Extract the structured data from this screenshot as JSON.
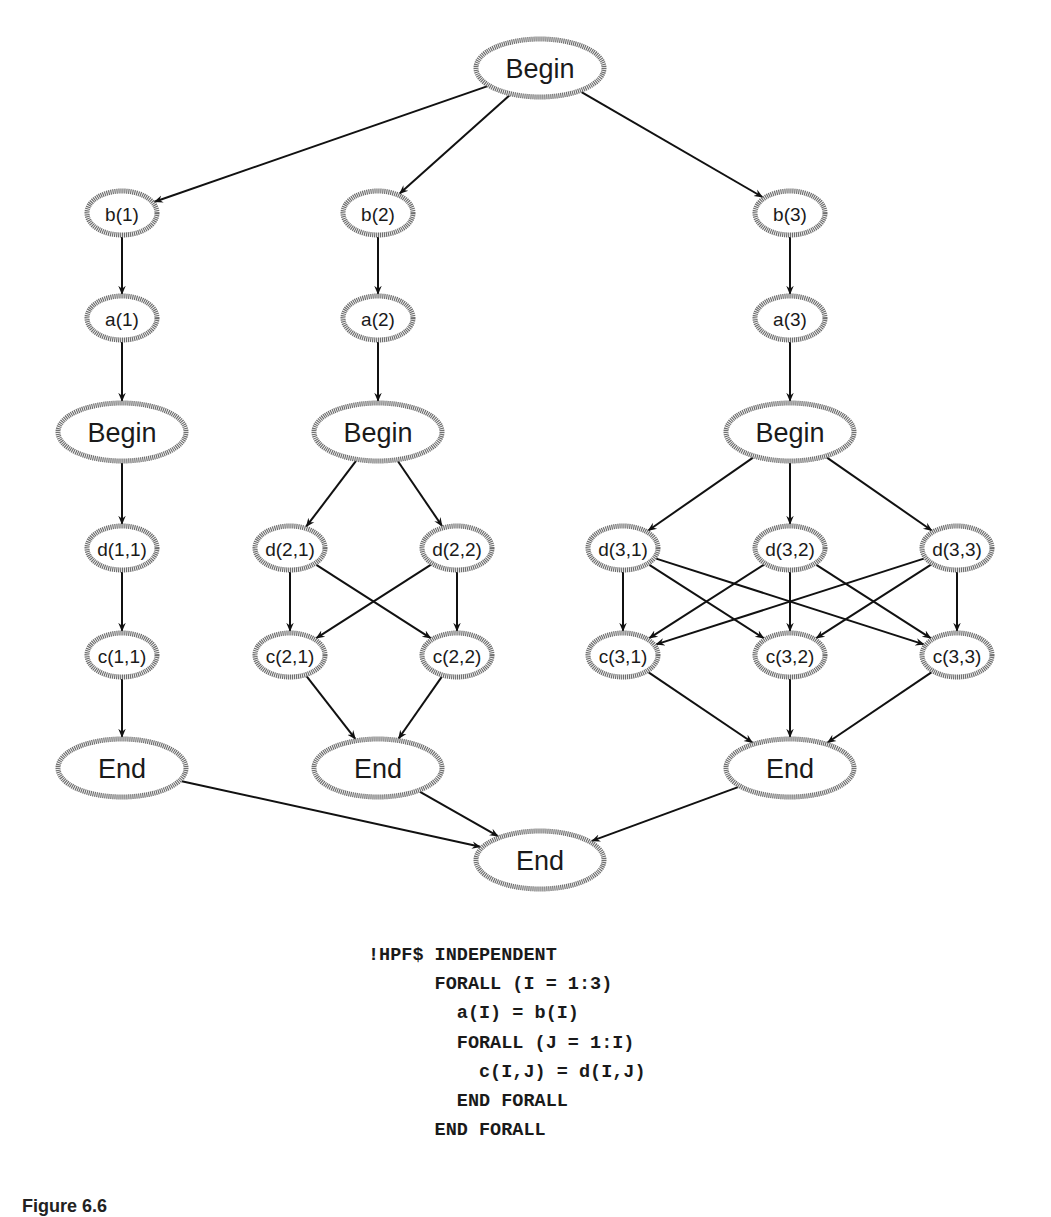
{
  "graph": {
    "nodes": [
      {
        "id": "root-begin",
        "label": "Begin",
        "x": 540,
        "y": 68,
        "size": "large"
      },
      {
        "id": "b1",
        "label": "b(1)",
        "x": 122,
        "y": 213,
        "size": "small"
      },
      {
        "id": "b2",
        "label": "b(2)",
        "x": 378,
        "y": 213,
        "size": "small"
      },
      {
        "id": "b3",
        "label": "b(3)",
        "x": 790,
        "y": 213,
        "size": "small"
      },
      {
        "id": "a1",
        "label": "a(1)",
        "x": 122,
        "y": 318,
        "size": "small"
      },
      {
        "id": "a2",
        "label": "a(2)",
        "x": 378,
        "y": 318,
        "size": "small"
      },
      {
        "id": "a3",
        "label": "a(3)",
        "x": 790,
        "y": 318,
        "size": "small"
      },
      {
        "id": "begin1",
        "label": "Begin",
        "x": 122,
        "y": 432,
        "size": "large"
      },
      {
        "id": "begin2",
        "label": "Begin",
        "x": 378,
        "y": 432,
        "size": "large"
      },
      {
        "id": "begin3",
        "label": "Begin",
        "x": 790,
        "y": 432,
        "size": "large"
      },
      {
        "id": "d11",
        "label": "d(1,1)",
        "x": 122,
        "y": 548,
        "size": "small"
      },
      {
        "id": "d21",
        "label": "d(2,1)",
        "x": 290,
        "y": 548,
        "size": "small"
      },
      {
        "id": "d22",
        "label": "d(2,2)",
        "x": 457,
        "y": 548,
        "size": "small"
      },
      {
        "id": "d31",
        "label": "d(3,1)",
        "x": 623,
        "y": 548,
        "size": "small"
      },
      {
        "id": "d32",
        "label": "d(3,2)",
        "x": 790,
        "y": 548,
        "size": "small"
      },
      {
        "id": "d33",
        "label": "d(3,3)",
        "x": 957,
        "y": 548,
        "size": "small"
      },
      {
        "id": "c11",
        "label": "c(1,1)",
        "x": 122,
        "y": 655,
        "size": "small"
      },
      {
        "id": "c21",
        "label": "c(2,1)",
        "x": 290,
        "y": 655,
        "size": "small"
      },
      {
        "id": "c22",
        "label": "c(2,2)",
        "x": 457,
        "y": 655,
        "size": "small"
      },
      {
        "id": "c31",
        "label": "c(3,1)",
        "x": 623,
        "y": 655,
        "size": "small"
      },
      {
        "id": "c32",
        "label": "c(3,2)",
        "x": 790,
        "y": 655,
        "size": "small"
      },
      {
        "id": "c33",
        "label": "c(3,3)",
        "x": 957,
        "y": 655,
        "size": "small"
      },
      {
        "id": "end1",
        "label": "End",
        "x": 122,
        "y": 768,
        "size": "large"
      },
      {
        "id": "end2",
        "label": "End",
        "x": 378,
        "y": 768,
        "size": "large"
      },
      {
        "id": "end3",
        "label": "End",
        "x": 790,
        "y": 768,
        "size": "large"
      },
      {
        "id": "root-end",
        "label": "End",
        "x": 540,
        "y": 860,
        "size": "large"
      }
    ],
    "edges": [
      [
        "root-begin",
        "b1"
      ],
      [
        "root-begin",
        "b2"
      ],
      [
        "root-begin",
        "b3"
      ],
      [
        "b1",
        "a1"
      ],
      [
        "b2",
        "a2"
      ],
      [
        "b3",
        "a3"
      ],
      [
        "a1",
        "begin1"
      ],
      [
        "a2",
        "begin2"
      ],
      [
        "a3",
        "begin3"
      ],
      [
        "begin1",
        "d11"
      ],
      [
        "begin2",
        "d21"
      ],
      [
        "begin2",
        "d22"
      ],
      [
        "begin3",
        "d31"
      ],
      [
        "begin3",
        "d32"
      ],
      [
        "begin3",
        "d33"
      ],
      [
        "d11",
        "c11"
      ],
      [
        "d21",
        "c21"
      ],
      [
        "d21",
        "c22"
      ],
      [
        "d22",
        "c21"
      ],
      [
        "d22",
        "c22"
      ],
      [
        "d31",
        "c31"
      ],
      [
        "d31",
        "c32"
      ],
      [
        "d31",
        "c33"
      ],
      [
        "d32",
        "c31"
      ],
      [
        "d32",
        "c32"
      ],
      [
        "d32",
        "c33"
      ],
      [
        "d33",
        "c31"
      ],
      [
        "d33",
        "c32"
      ],
      [
        "d33",
        "c33"
      ],
      [
        "c11",
        "end1"
      ],
      [
        "c21",
        "end2"
      ],
      [
        "c22",
        "end2"
      ],
      [
        "c31",
        "end3"
      ],
      [
        "c32",
        "end3"
      ],
      [
        "c33",
        "end3"
      ],
      [
        "end1",
        "root-end"
      ],
      [
        "end2",
        "root-end"
      ],
      [
        "end3",
        "root-end"
      ]
    ]
  },
  "code": {
    "lines": [
      "!HPF$ INDEPENDENT",
      "      FORALL (I = 1:3)",
      "        a(I) = b(I)",
      "        FORALL (J = 1:I)",
      "          c(I,J) = d(I,J)",
      "        END FORALL",
      "      END FORALL"
    ]
  },
  "caption": {
    "text": "Figure 6.6"
  }
}
